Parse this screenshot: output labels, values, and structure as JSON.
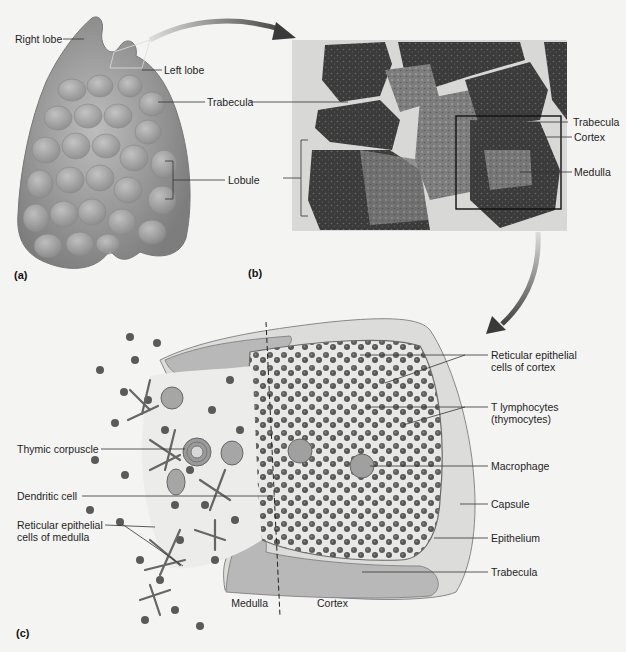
{
  "figure": {
    "panels": {
      "a": {
        "letter": "(a)",
        "labels": {
          "right_lobe": "Right lobe",
          "left_lobe": "Left lobe",
          "trabecula": "Trabecula",
          "lobule": "Lobule"
        }
      },
      "b": {
        "letter": "(b)",
        "labels": {
          "trabecula": "Trabecula",
          "cortex": "Cortex",
          "medulla": "Medulla"
        }
      },
      "c": {
        "letter": "(c)",
        "labels": {
          "reticular_cortex_1": "Reticular epithelial",
          "reticular_cortex_2": "cells of cortex",
          "t_lymph_1": "T lymphocytes",
          "t_lymph_2": "(thymocytes)",
          "macrophage": "Macrophage",
          "capsule": "Capsule",
          "epithelium": "Epithelium",
          "trabecula": "Trabecula",
          "thymic_corpuscle": "Thymic corpuscle",
          "dendritic_cell": "Dendritic cell",
          "reticular_medulla_1": "Reticular epithelial",
          "reticular_medulla_2": "cells of medulla",
          "medulla": "Medulla",
          "cortex": "Cortex"
        }
      }
    },
    "colors": {
      "background": "#f4f4f3",
      "tissue_dark": "#3a3a3a",
      "tissue_light": "#c9c9c9",
      "organ": "#9a9a9a",
      "leader_line": "#333333"
    }
  }
}
